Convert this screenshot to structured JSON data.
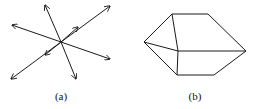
{
  "figure_a": {
    "label": "(a)",
    "description": "Star of arrows radiating from a common center",
    "center": [
      61,
      42
    ],
    "arrow_tips": [
      [
        12,
        25
      ],
      [
        45,
        5
      ],
      [
        110,
        6
      ],
      [
        78,
        27
      ],
      [
        110,
        59
      ],
      [
        76,
        79
      ],
      [
        11,
        79
      ],
      [
        45,
        55
      ]
    ]
  },
  "figure_b": {
    "label": "(b)",
    "description": "Polyhedral wireframe (pentagonal prism-like shape)",
    "vertices": {
      "top_left": [
        172,
        14
      ],
      "top_right": [
        208,
        14
      ],
      "left": [
        144,
        42
      ],
      "center": [
        178,
        51
      ],
      "right": [
        246,
        51
      ],
      "bottom_left": [
        177,
        75
      ],
      "bottom_right": [
        214,
        75
      ]
    }
  },
  "colors": {
    "stroke": "#1a1a1a",
    "background": "#ffffff"
  }
}
